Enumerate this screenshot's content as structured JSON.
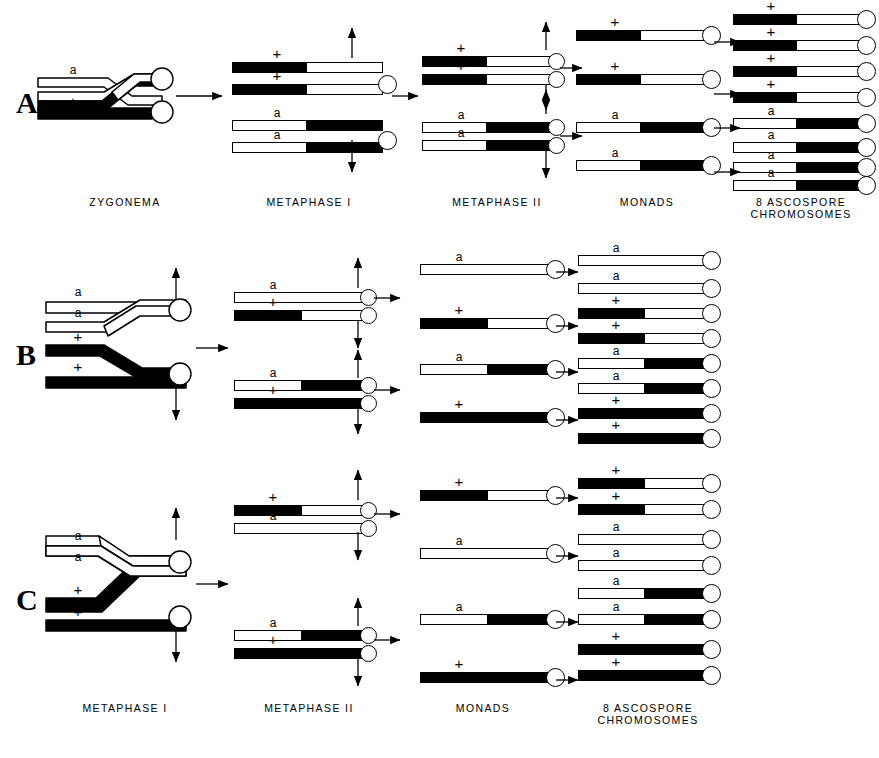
{
  "figure": {
    "type": "meiosis-crossover-diagram",
    "background": "#ffffff",
    "ink": "#000000",
    "width": 879,
    "height": 758
  },
  "row_letters": [
    {
      "label": "A",
      "x": 16,
      "y": 88
    },
    {
      "label": "B",
      "x": 16,
      "y": 340
    },
    {
      "label": "C",
      "x": 16,
      "y": 585
    }
  ],
  "stage_labels_top": [
    {
      "line1": "ZYGONEMA",
      "line2": "",
      "x": 60,
      "y": 196,
      "w": 130
    },
    {
      "line1": "METAPHASE I",
      "line2": "",
      "x": 244,
      "y": 196,
      "w": 130
    },
    {
      "line1": "METAPHASE ΙΙ",
      "line2": "",
      "x": 432,
      "y": 196,
      "w": 130
    },
    {
      "line1": "MONADS",
      "line2": "",
      "x": 592,
      "y": 196,
      "w": 110
    },
    {
      "line1": "8 ASCOSPORE",
      "line2": "CHROMOSOMES",
      "x": 731,
      "y": 196,
      "w": 140
    }
  ],
  "stage_labels_bottom": [
    {
      "line1": "METAPHASE I",
      "line2": "",
      "x": 60,
      "y": 702,
      "w": 130
    },
    {
      "line1": "METAPHASE ΙΙ",
      "line2": "",
      "x": 244,
      "y": 702,
      "w": 130
    },
    {
      "line1": "MONADS",
      "line2": "",
      "x": 428,
      "y": 702,
      "w": 110
    },
    {
      "line1": "8 ASCOSPORE",
      "line2": "CHROMOSOMES",
      "x": 578,
      "y": 702,
      "w": 140
    }
  ],
  "alleles": {
    "a": "a",
    "plus": "+"
  },
  "rowA": {
    "zygonema": {
      "strand_top_allele": "a",
      "strand_bottom_allele": "+",
      "crossover": "single-chromatid"
    },
    "metaphase1": [
      {
        "allele": "+",
        "segments": [
          {
            "color": "black",
            "frac": 0.5
          },
          {
            "color": "white",
            "frac": 0.5
          }
        ]
      },
      {
        "allele": "+",
        "segments": [
          {
            "color": "black",
            "frac": 0.5
          },
          {
            "color": "white",
            "frac": 0.5
          }
        ]
      },
      {
        "allele": "a",
        "segments": [
          {
            "color": "white",
            "frac": 0.5
          },
          {
            "color": "black",
            "frac": 0.5
          }
        ]
      },
      {
        "allele": "a",
        "segments": [
          {
            "color": "white",
            "frac": 0.5
          },
          {
            "color": "black",
            "frac": 0.5
          }
        ]
      }
    ],
    "metaphase2": [
      {
        "allele": "+",
        "segments": [
          {
            "color": "black",
            "frac": 0.5
          },
          {
            "color": "white",
            "frac": 0.5
          }
        ]
      },
      {
        "allele": "+",
        "segments": [
          {
            "color": "black",
            "frac": 0.5
          },
          {
            "color": "white",
            "frac": 0.5
          }
        ]
      },
      {
        "allele": "a",
        "segments": [
          {
            "color": "white",
            "frac": 0.5
          },
          {
            "color": "black",
            "frac": 0.5
          }
        ]
      },
      {
        "allele": "a",
        "segments": [
          {
            "color": "white",
            "frac": 0.5
          },
          {
            "color": "black",
            "frac": 0.5
          }
        ]
      }
    ],
    "monads": [
      {
        "allele": "+",
        "segments": [
          {
            "color": "black",
            "frac": 0.5
          },
          {
            "color": "white",
            "frac": 0.5
          }
        ]
      },
      {
        "allele": "+",
        "segments": [
          {
            "color": "black",
            "frac": 0.5
          },
          {
            "color": "white",
            "frac": 0.5
          }
        ]
      },
      {
        "allele": "a",
        "segments": [
          {
            "color": "white",
            "frac": 0.5
          },
          {
            "color": "black",
            "frac": 0.5
          }
        ]
      },
      {
        "allele": "a",
        "segments": [
          {
            "color": "white",
            "frac": 0.5
          },
          {
            "color": "black",
            "frac": 0.5
          }
        ]
      }
    ],
    "ascospores": [
      {
        "allele": "+",
        "segments": [
          {
            "color": "black",
            "frac": 0.5
          },
          {
            "color": "white",
            "frac": 0.5
          }
        ]
      },
      {
        "allele": "+",
        "segments": [
          {
            "color": "black",
            "frac": 0.5
          },
          {
            "color": "white",
            "frac": 0.5
          }
        ]
      },
      {
        "allele": "+",
        "segments": [
          {
            "color": "black",
            "frac": 0.5
          },
          {
            "color": "white",
            "frac": 0.5
          }
        ]
      },
      {
        "allele": "+",
        "segments": [
          {
            "color": "black",
            "frac": 0.5
          },
          {
            "color": "white",
            "frac": 0.5
          }
        ]
      },
      {
        "allele": "a",
        "segments": [
          {
            "color": "white",
            "frac": 0.5
          },
          {
            "color": "black",
            "frac": 0.5
          }
        ]
      },
      {
        "allele": "a",
        "segments": [
          {
            "color": "white",
            "frac": 0.5
          },
          {
            "color": "black",
            "frac": 0.5
          }
        ]
      },
      {
        "allele": "a",
        "segments": [
          {
            "color": "white",
            "frac": 0.5
          },
          {
            "color": "black",
            "frac": 0.5
          }
        ]
      },
      {
        "allele": "a",
        "segments": [
          {
            "color": "white",
            "frac": 0.5
          },
          {
            "color": "black",
            "frac": 0.5
          }
        ]
      }
    ]
  },
  "rowB": {
    "metaphase1": [
      {
        "allele": "a",
        "segments": [
          {
            "color": "white",
            "frac": 1.0
          }
        ]
      },
      {
        "allele": "a",
        "segments": [
          {
            "color": "white",
            "frac": 1.0
          }
        ]
      },
      {
        "allele": "+",
        "segments": [
          {
            "color": "black",
            "frac": 1.0
          }
        ]
      },
      {
        "allele": "+",
        "segments": [
          {
            "color": "black",
            "frac": 1.0
          }
        ]
      }
    ],
    "metaphase2": [
      {
        "allele": "a",
        "segments": [
          {
            "color": "white",
            "frac": 1.0
          }
        ]
      },
      {
        "allele": "+",
        "segments": [
          {
            "color": "black",
            "frac": 0.52
          },
          {
            "color": "white",
            "frac": 0.48
          }
        ]
      },
      {
        "allele": "a",
        "segments": [
          {
            "color": "white",
            "frac": 0.52
          },
          {
            "color": "black",
            "frac": 0.48
          }
        ]
      },
      {
        "allele": "+",
        "segments": [
          {
            "color": "black",
            "frac": 1.0
          }
        ]
      }
    ],
    "monads": [
      {
        "allele": "a",
        "segments": [
          {
            "color": "white",
            "frac": 1.0
          }
        ]
      },
      {
        "allele": "+",
        "segments": [
          {
            "color": "black",
            "frac": 0.52
          },
          {
            "color": "white",
            "frac": 0.48
          }
        ]
      },
      {
        "allele": "a",
        "segments": [
          {
            "color": "white",
            "frac": 0.52
          },
          {
            "color": "black",
            "frac": 0.48
          }
        ]
      },
      {
        "allele": "+",
        "segments": [
          {
            "color": "black",
            "frac": 1.0
          }
        ]
      }
    ],
    "ascospores": [
      {
        "allele": "a",
        "segments": [
          {
            "color": "white",
            "frac": 1.0
          }
        ]
      },
      {
        "allele": "a",
        "segments": [
          {
            "color": "white",
            "frac": 1.0
          }
        ]
      },
      {
        "allele": "+",
        "segments": [
          {
            "color": "black",
            "frac": 0.52
          },
          {
            "color": "white",
            "frac": 0.48
          }
        ]
      },
      {
        "allele": "+",
        "segments": [
          {
            "color": "black",
            "frac": 0.52
          },
          {
            "color": "white",
            "frac": 0.48
          }
        ]
      },
      {
        "allele": "a",
        "segments": [
          {
            "color": "white",
            "frac": 0.52
          },
          {
            "color": "black",
            "frac": 0.48
          }
        ]
      },
      {
        "allele": "a",
        "segments": [
          {
            "color": "white",
            "frac": 0.52
          },
          {
            "color": "black",
            "frac": 0.48
          }
        ]
      },
      {
        "allele": "+",
        "segments": [
          {
            "color": "black",
            "frac": 1.0
          }
        ]
      },
      {
        "allele": "+",
        "segments": [
          {
            "color": "black",
            "frac": 1.0
          }
        ]
      }
    ]
  },
  "rowC": {
    "metaphase1": [
      {
        "allele": "a",
        "segments": [
          {
            "color": "white",
            "frac": 1.0
          }
        ]
      },
      {
        "allele": "a",
        "segments": [
          {
            "color": "white",
            "frac": 1.0
          }
        ]
      },
      {
        "allele": "+",
        "segments": [
          {
            "color": "black",
            "frac": 1.0
          }
        ]
      },
      {
        "allele": "+",
        "segments": [
          {
            "color": "black",
            "frac": 1.0
          }
        ]
      }
    ],
    "metaphase2": [
      {
        "allele": "+",
        "segments": [
          {
            "color": "black",
            "frac": 0.52
          },
          {
            "color": "white",
            "frac": 0.48
          }
        ]
      },
      {
        "allele": "a",
        "segments": [
          {
            "color": "white",
            "frac": 1.0
          }
        ]
      },
      {
        "allele": "a",
        "segments": [
          {
            "color": "white",
            "frac": 0.52
          },
          {
            "color": "black",
            "frac": 0.48
          }
        ]
      },
      {
        "allele": "+",
        "segments": [
          {
            "color": "black",
            "frac": 1.0
          }
        ]
      }
    ],
    "monads": [
      {
        "allele": "+",
        "segments": [
          {
            "color": "black",
            "frac": 0.52
          },
          {
            "color": "white",
            "frac": 0.48
          }
        ]
      },
      {
        "allele": "a",
        "segments": [
          {
            "color": "white",
            "frac": 1.0
          }
        ]
      },
      {
        "allele": "a",
        "segments": [
          {
            "color": "white",
            "frac": 0.52
          },
          {
            "color": "black",
            "frac": 0.48
          }
        ]
      },
      {
        "allele": "+",
        "segments": [
          {
            "color": "black",
            "frac": 1.0
          }
        ]
      }
    ],
    "ascospores": [
      {
        "allele": "+",
        "segments": [
          {
            "color": "black",
            "frac": 0.52
          },
          {
            "color": "white",
            "frac": 0.48
          }
        ]
      },
      {
        "allele": "+",
        "segments": [
          {
            "color": "black",
            "frac": 0.52
          },
          {
            "color": "white",
            "frac": 0.48
          }
        ]
      },
      {
        "allele": "a",
        "segments": [
          {
            "color": "white",
            "frac": 1.0
          }
        ]
      },
      {
        "allele": "a",
        "segments": [
          {
            "color": "white",
            "frac": 1.0
          }
        ]
      },
      {
        "allele": "a",
        "segments": [
          {
            "color": "white",
            "frac": 0.52
          },
          {
            "color": "black",
            "frac": 0.48
          }
        ]
      },
      {
        "allele": "a",
        "segments": [
          {
            "color": "white",
            "frac": 0.52
          },
          {
            "color": "black",
            "frac": 0.48
          }
        ]
      },
      {
        "allele": "+",
        "segments": [
          {
            "color": "black",
            "frac": 1.0
          }
        ]
      },
      {
        "allele": "+",
        "segments": [
          {
            "color": "black",
            "frac": 1.0
          }
        ]
      }
    ]
  },
  "layout": {
    "rowA": {
      "m1": {
        "x": 232,
        "w": 150,
        "ys": [
          62,
          84,
          120,
          142
        ],
        "cent": [
          {
            "y": 74
          },
          {
            "y": 130
          }
        ]
      },
      "m2": {
        "x": 422,
        "w": 130,
        "ys": [
          56,
          74,
          122,
          140
        ],
        "cent": [
          {
            "y": 56
          },
          {
            "y": 122
          }
        ]
      },
      "mon": {
        "x": 576,
        "w": 130,
        "ys": [
          30,
          74,
          122,
          160
        ],
        "cent": [
          {
            "y": 30
          },
          {
            "y": 74
          },
          {
            "y": 122
          },
          {
            "y": 160
          }
        ]
      },
      "asc": {
        "x": 733,
        "w": 128,
        "ys": [
          14,
          40,
          66,
          92,
          118,
          142,
          162,
          180
        ]
      }
    },
    "rowB": {
      "m1": {
        "x": 46,
        "w": 160,
        "ys": [
          304,
          326,
          354,
          378
        ],
        "cent": [
          {
            "y": 316
          },
          {
            "y": 366
          }
        ]
      },
      "m2": {
        "x": 234,
        "w": 130,
        "ys": [
          292,
          310,
          380,
          398
        ],
        "cent": [
          {
            "y": 292
          },
          {
            "y": 380
          }
        ]
      },
      "mon": {
        "x": 420,
        "w": 130,
        "ys": [
          264,
          318,
          364,
          412
        ],
        "cent": [
          {
            "y": 264
          },
          {
            "y": 318
          },
          {
            "y": 364
          },
          {
            "y": 412
          }
        ]
      },
      "asc": {
        "x": 578,
        "w": 128,
        "ys": [
          255,
          283,
          308,
          333,
          358,
          383,
          408,
          433
        ]
      }
    },
    "rowC": {
      "m1": {
        "x": 46,
        "w": 160,
        "ys": [
          548,
          568,
          600,
          622
        ],
        "cent": [
          {
            "y": 558
          },
          {
            "y": 610
          }
        ]
      },
      "m2": {
        "x": 234,
        "w": 130,
        "ys": [
          505,
          523,
          630,
          648
        ],
        "cent": [
          {
            "y": 505
          },
          {
            "y": 630
          }
        ]
      },
      "mon": {
        "x": 420,
        "w": 130,
        "ys": [
          490,
          548,
          614,
          672
        ],
        "cent": [
          {
            "y": 490
          },
          {
            "y": 548
          },
          {
            "y": 614
          },
          {
            "y": 672
          }
        ]
      },
      "asc": {
        "x": 578,
        "w": 128,
        "ys": [
          478,
          504,
          534,
          560,
          588,
          614,
          644,
          670
        ]
      }
    }
  }
}
